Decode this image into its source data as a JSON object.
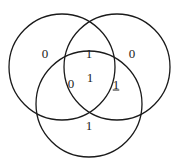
{
  "diagram": {
    "type": "venn-3-circle",
    "background_color": "#ffffff",
    "stroke_color": "#1a1a1a",
    "text_color": "#1a1a1a",
    "circles": [
      {
        "name": "left-circle",
        "cx": 62,
        "cy": 67,
        "r": 53
      },
      {
        "name": "right-circle",
        "cx": 117,
        "cy": 67,
        "r": 53
      },
      {
        "name": "bottom-circle",
        "cx": 89,
        "cy": 104,
        "r": 53
      }
    ],
    "regions": [
      {
        "id": "left-only",
        "label": "0",
        "x": 45,
        "y": 53,
        "underlined": false
      },
      {
        "id": "right-only",
        "label": "0",
        "x": 132,
        "y": 53,
        "underlined": false
      },
      {
        "id": "left-right",
        "label": "1",
        "x": 89,
        "y": 53,
        "underlined": false
      },
      {
        "id": "left-bottom",
        "label": "0",
        "x": 71,
        "y": 83,
        "underlined": false
      },
      {
        "id": "center-all-three",
        "label": "1",
        "x": 90,
        "y": 77,
        "underlined": false
      },
      {
        "id": "right-bottom",
        "label": "1",
        "x": 116,
        "y": 84,
        "underlined": true
      },
      {
        "id": "bottom-only",
        "label": "1",
        "x": 89,
        "y": 125,
        "underlined": false
      }
    ]
  }
}
